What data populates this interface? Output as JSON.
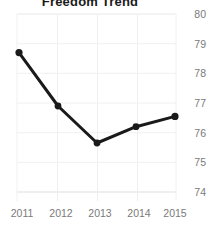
{
  "chart_data": {
    "type": "line",
    "title": "Freedom Trend",
    "xlabel": "",
    "ylabel": "",
    "categories": [
      "2011",
      "2012",
      "2013",
      "2014",
      "2015"
    ],
    "x": [
      2011,
      2012,
      2013,
      2014,
      2015
    ],
    "values": [
      78.7,
      76.9,
      75.65,
      76.2,
      76.55
    ],
    "series": [
      {
        "name": "Freedom Trend",
        "values": [
          78.7,
          76.9,
          75.65,
          76.2,
          76.55
        ]
      }
    ],
    "ylim": [
      74,
      80
    ],
    "yticks": [
      80,
      79,
      78,
      77,
      76,
      75,
      74
    ],
    "ytick_labels": [
      "80",
      "79",
      "78",
      "77",
      "76",
      "75",
      "74"
    ],
    "xtick_labels": [
      "2011",
      "2012",
      "2013",
      "2014",
      "2015"
    ],
    "grid": true,
    "legend": false,
    "legend_position": "none",
    "y_axis_side": "right",
    "marker": "circle",
    "line_color": "#1a1a1a",
    "marker_color": "#1a1a1a",
    "grid_color": "#e8e8e8",
    "tick_label_color": "#7a7a7a",
    "background_color": "#ffffff"
  }
}
